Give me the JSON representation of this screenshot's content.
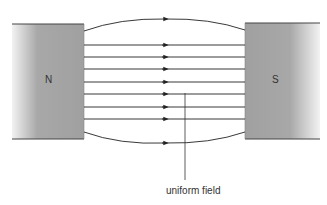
{
  "diagram": {
    "magnets": [
      {
        "pole": "N",
        "side": "left"
      },
      {
        "pole": "S",
        "side": "right"
      }
    ],
    "field_lines": {
      "count": 9,
      "direction": "N to S"
    },
    "annotation": "uniform field",
    "colors": {
      "magnet": "#a3a3a3",
      "line": "#222222"
    }
  }
}
